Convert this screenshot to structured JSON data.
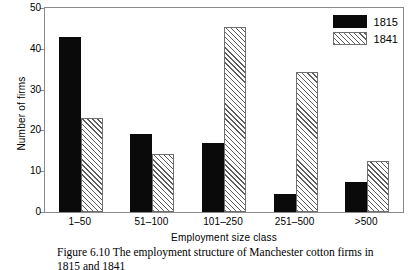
{
  "chart_data": {
    "type": "bar",
    "title": "",
    "xlabel": "Employment size class",
    "ylabel": "Number of firms",
    "categories": [
      "1–50",
      "51–100",
      "101–250",
      "251–500",
      ">500"
    ],
    "series": [
      {
        "name": "1815",
        "values": [
          43,
          19,
          17,
          4.3,
          7.4
        ],
        "color": "#0a0a0a",
        "fill": "solid"
      },
      {
        "name": "1841",
        "values": [
          23,
          14.2,
          45.3,
          34.4,
          12.4
        ],
        "color": "#5d5d5d",
        "fill": "diagonal-hatch"
      }
    ],
    "ylim": [
      0,
      50
    ],
    "yticks": [
      0,
      10,
      20,
      30,
      40,
      50
    ],
    "grid": false,
    "legend_position": "top-right"
  },
  "legend": {
    "items": [
      {
        "label": "1815"
      },
      {
        "label": "1841"
      }
    ]
  },
  "caption": {
    "line1": "Figure 6.10  The employment structure of Manchester cotton firms in",
    "line2": "1815 and 1841"
  }
}
